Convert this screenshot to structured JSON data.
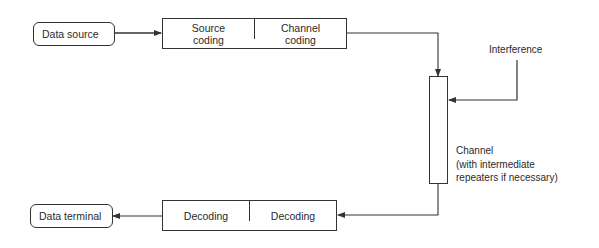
{
  "diagram": {
    "type": "block-diagram",
    "title": "",
    "nodes": {
      "data_source": {
        "label": "Data source"
      },
      "encoder": {
        "cells": [
          "Source\ncoding",
          "Channel\ncoding"
        ]
      },
      "channel": {
        "label": "Channel\n(with intermediate\nrepeaters if necessary)"
      },
      "interference": {
        "label": "Interference"
      },
      "decoder": {
        "cells": [
          "Decoding",
          "Decoding"
        ]
      },
      "data_terminal": {
        "label": "Data terminal"
      }
    },
    "edges": [
      {
        "from": "data_source",
        "to": "encoder"
      },
      {
        "from": "encoder",
        "to": "channel"
      },
      {
        "from": "interference",
        "to": "channel"
      },
      {
        "from": "channel",
        "to": "decoder"
      },
      {
        "from": "decoder",
        "to": "data_terminal"
      }
    ],
    "colors": {
      "stroke": "#333333",
      "text": "#2a2a2a",
      "background": "#ffffff"
    }
  }
}
